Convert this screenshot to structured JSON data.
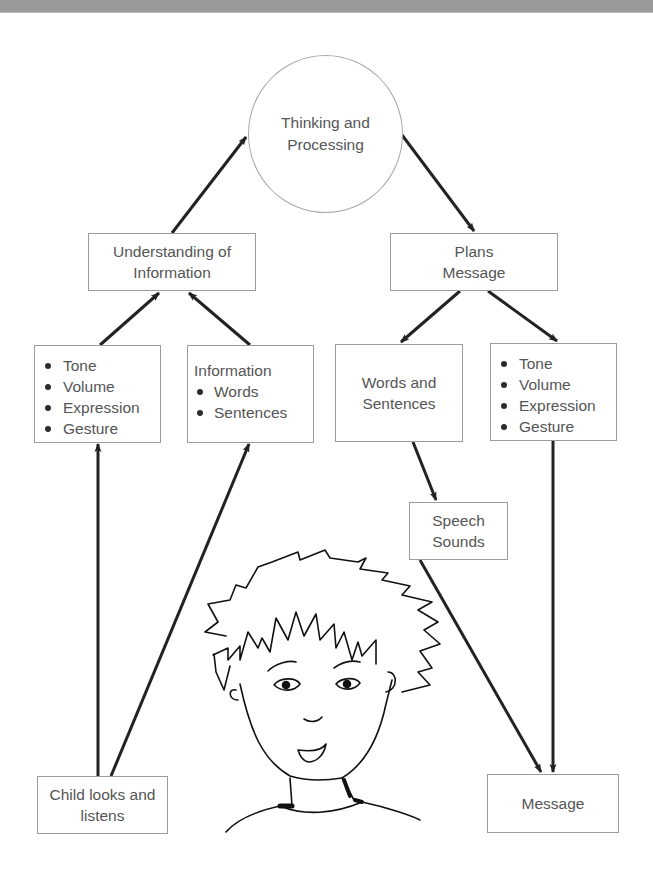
{
  "diagram": {
    "title": "",
    "colors": {
      "arrow": "#222222",
      "box_border": "#9c9c9c",
      "text": "#555555",
      "drawing": "#111111"
    },
    "nodes": {
      "thinking": {
        "line1": "Thinking and",
        "line2": "Processing"
      },
      "understanding": {
        "line1": "Understanding of",
        "line2": "Information"
      },
      "plans": {
        "line1": "Plans",
        "line2": "Message"
      },
      "nonverbal_in": {
        "items": [
          "Tone",
          "Volume",
          "Expression",
          "Gesture"
        ]
      },
      "information": {
        "title": "Information",
        "items": [
          "Words",
          "Sentences"
        ]
      },
      "words_sentences": {
        "line1": "Words and",
        "line2": "Sentences"
      },
      "nonverbal_out": {
        "items": [
          "Tone",
          "Volume",
          "Expression",
          "Gesture"
        ]
      },
      "speech_sounds": {
        "line1": "Speech",
        "line2": "Sounds"
      },
      "child": {
        "line1": "Child looks and",
        "line2": "listens"
      },
      "message": {
        "line1": "Message"
      }
    },
    "edges": [
      {
        "from": "child",
        "to": "nonverbal_in"
      },
      {
        "from": "child",
        "to": "information"
      },
      {
        "from": "nonverbal_in",
        "to": "understanding"
      },
      {
        "from": "information",
        "to": "understanding"
      },
      {
        "from": "understanding",
        "to": "thinking"
      },
      {
        "from": "thinking",
        "to": "plans"
      },
      {
        "from": "plans",
        "to": "words_sentences"
      },
      {
        "from": "plans",
        "to": "nonverbal_out"
      },
      {
        "from": "words_sentences",
        "to": "speech_sounds"
      },
      {
        "from": "speech_sounds",
        "to": "message"
      },
      {
        "from": "nonverbal_out",
        "to": "message"
      }
    ],
    "illustration": "child-face"
  }
}
